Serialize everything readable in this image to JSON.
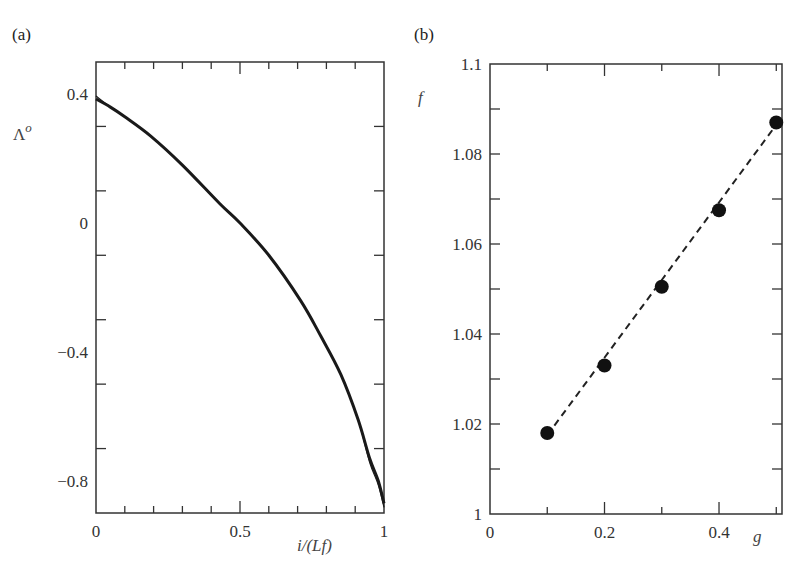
{
  "figure": {
    "panels": [
      {
        "id": "a",
        "label": "(a)",
        "xlabel": "i/(Lf)",
        "ylabel": "Λ",
        "ylabel_sup": "o",
        "xlim": [
          0,
          1
        ],
        "ylim": [
          -0.9,
          0.5
        ],
        "xticks": [
          {
            "value": 0,
            "label": "0"
          },
          {
            "value": 0.5,
            "label": "0.5"
          },
          {
            "value": 1,
            "label": "1"
          }
        ],
        "yticks": [
          {
            "value": 0.4,
            "label": "0.4"
          },
          {
            "value": 0,
            "label": "0"
          },
          {
            "value": -0.4,
            "label": "−0.4"
          },
          {
            "value": -0.8,
            "label": "−0.8"
          }
        ],
        "x_minor_step": 0.1,
        "y_minor_step": 0.2
      },
      {
        "id": "b",
        "label": "(b)",
        "xlabel": "g",
        "ylabel": "f",
        "xlim": [
          0,
          0.51
        ],
        "ylim": [
          1.0,
          1.1
        ],
        "xticks": [
          {
            "value": 0,
            "label": "0"
          },
          {
            "value": 0.2,
            "label": "0.2"
          },
          {
            "value": 0.4,
            "label": "0.4"
          }
        ],
        "yticks": [
          {
            "value": 1.0,
            "label": "1"
          },
          {
            "value": 1.02,
            "label": "1.02"
          },
          {
            "value": 1.04,
            "label": "1.04"
          },
          {
            "value": 1.06,
            "label": "1.06"
          },
          {
            "value": 1.08,
            "label": "1.08"
          },
          {
            "value": 1.1,
            "label": "1.1"
          }
        ],
        "x_minor_step": 0.1,
        "y_minor_step": 0.01
      }
    ]
  },
  "chart_data": [
    {
      "type": "line",
      "title": "(a)",
      "xlabel": "i/(Lf)",
      "ylabel": "Λ^o",
      "xlim": [
        0,
        1
      ],
      "ylim": [
        -0.9,
        0.5
      ],
      "grid": false,
      "legend": null,
      "series": [
        {
          "name": "Λ^o curve (several overlapping curves)",
          "x": [
            0.0,
            0.05,
            0.1,
            0.19,
            0.3,
            0.43,
            0.5,
            0.6,
            0.71,
            0.78,
            0.85,
            0.91,
            0.95,
            0.98,
            1.0
          ],
          "y": [
            0.385,
            0.36,
            0.33,
            0.27,
            0.18,
            0.06,
            0.0,
            -0.1,
            -0.24,
            -0.35,
            -0.47,
            -0.61,
            -0.73,
            -0.8,
            -0.87
          ],
          "style": "solid",
          "color": "#1a1a1a"
        }
      ]
    },
    {
      "type": "scatter",
      "title": "(b)",
      "xlabel": "g",
      "ylabel": "f",
      "xlim": [
        0,
        0.51
      ],
      "ylim": [
        1.0,
        1.1
      ],
      "grid": false,
      "legend": null,
      "series": [
        {
          "name": "f vs g",
          "x": [
            0.1,
            0.2,
            0.3,
            0.4,
            0.5
          ],
          "y": [
            1.018,
            1.033,
            1.0505,
            1.0675,
            1.087
          ],
          "marker": "filled-circle",
          "color": "#111111"
        },
        {
          "name": "linear fit",
          "type": "line",
          "style": "dashed",
          "x": [
            0.1,
            0.5
          ],
          "y": [
            1.0175,
            1.0865
          ],
          "color": "#222222"
        }
      ]
    }
  ]
}
